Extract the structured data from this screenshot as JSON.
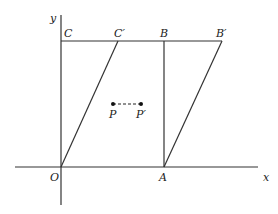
{
  "diagram": {
    "type": "shear-transformation",
    "axes": {
      "x_label": "x",
      "y_label": "y",
      "origin_label": "O"
    },
    "points": {
      "O": {
        "label": "O",
        "x": 61,
        "y": 167
      },
      "A": {
        "label": "A",
        "x": 164,
        "y": 167
      },
      "B": {
        "label": "B",
        "x": 164,
        "y": 41
      },
      "C": {
        "label": "C",
        "x": 61,
        "y": 41
      },
      "B_prime": {
        "label": "B′",
        "x": 222,
        "y": 41
      },
      "C_prime": {
        "label": "C′",
        "x": 118,
        "y": 41
      },
      "P": {
        "label": "P",
        "x": 113,
        "y": 104
      },
      "P_prime": {
        "label": "P′",
        "x": 141,
        "y": 104
      }
    },
    "shapes": {
      "original_rectangle": [
        "O",
        "A",
        "B",
        "C"
      ],
      "sheared_parallelogram": [
        "O",
        "A",
        "B′",
        "C′"
      ]
    },
    "colors": {
      "line": "#333333",
      "text": "#222222",
      "background": "#ffffff"
    }
  }
}
